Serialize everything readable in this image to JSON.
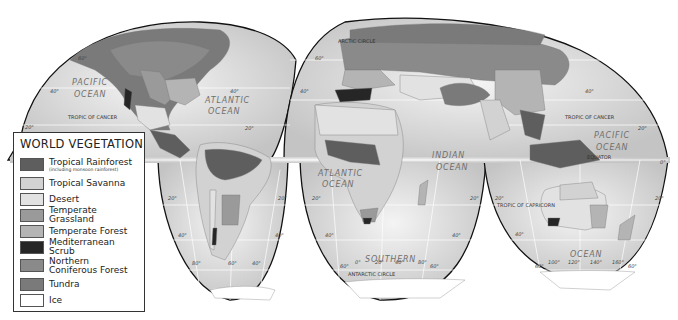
{
  "title": "WORLD VEGETATION",
  "legend": {
    "title": "WORLD VEGETATION",
    "items": [
      {
        "label": "Tropical Rainforest",
        "sublabel": "(including monsoon rainforest)",
        "color": "#5e5e5e"
      },
      {
        "label": "Tropical Savanna",
        "color": "#d2d2d2"
      },
      {
        "label": "Desert",
        "color": "#e2e2e2"
      },
      {
        "label": "Temperate Grassland",
        "color": "#9a9a9a"
      },
      {
        "label": "Temperate Forest",
        "color": "#b4b4b4"
      },
      {
        "label": "Mediterranean Scrub",
        "color": "#262626"
      },
      {
        "label": "Northern Coniferous Forest",
        "color": "#8a8a8a"
      },
      {
        "label": "Tundra",
        "color": "#7a7a7a"
      },
      {
        "label": "Ice",
        "color": "#ffffff"
      }
    ]
  },
  "oceans": {
    "pacific_west": [
      "PACIFIC",
      "OCEAN"
    ],
    "atlantic_north": [
      "ATLANTIC",
      "OCEAN"
    ],
    "atlantic_south": [
      "ATLANTIC",
      "OCEAN"
    ],
    "indian": [
      "INDIAN",
      "OCEAN"
    ],
    "pacific_east": [
      "PACIFIC",
      "OCEAN"
    ],
    "southern_1": "SOUTHERN",
    "southern_2": "OCEAN"
  },
  "lines": {
    "tropic_cancer": "TROPIC OF CANCER",
    "tropic_capricorn": "TROPIC OF CAPRICORN",
    "equator": "EQUATOR",
    "arctic_circle": "ARCTIC CIRCLE",
    "antarctic_circle": "ANTARCTIC CIRCLE"
  },
  "degrees": {
    "d0": "0°",
    "d20": "20°",
    "d40": "40°",
    "d60": "60°",
    "d80": "80°",
    "d100": "100°",
    "d120": "120°",
    "d140": "140°",
    "d160": "160°"
  }
}
